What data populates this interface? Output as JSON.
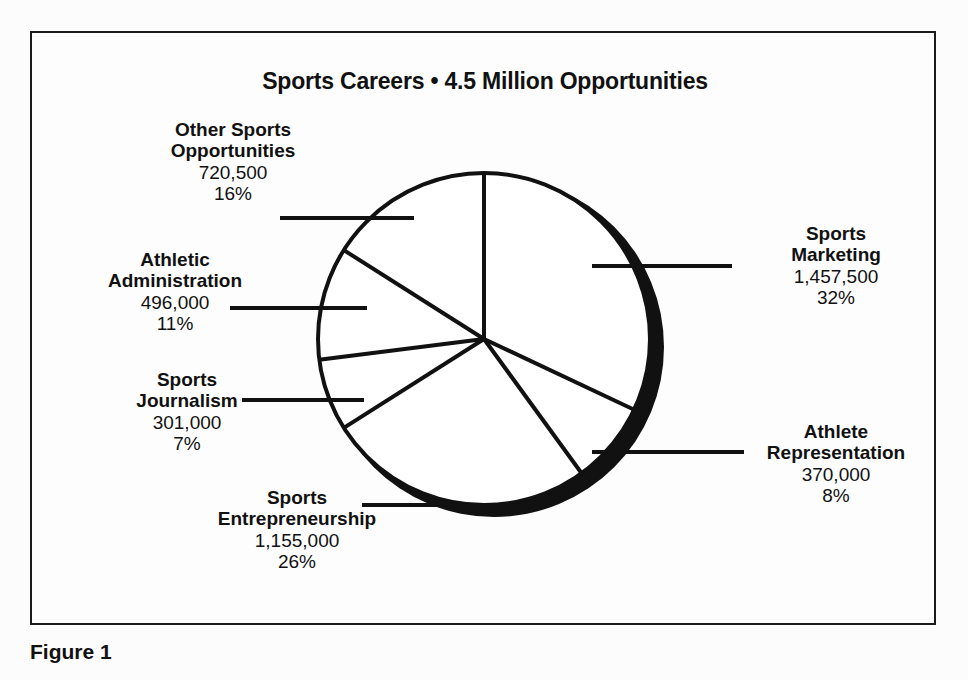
{
  "figure": {
    "title": "Sports Careers • 4.5 Million Opportunities",
    "caption": "Figure 1"
  },
  "colors": {
    "ink": "#111111",
    "slice_fill": "#ffffff",
    "shadow": "#111111",
    "background": "#fdfdfd"
  },
  "chart_data": {
    "type": "pie",
    "title": "Sports Careers • 4.5 Million Opportunities",
    "total_label": "4.5 Million Opportunities",
    "total_value": 4500000,
    "legend_position": "callout-labels",
    "grid": false,
    "categories": [
      "Sports Marketing",
      "Athlete Representation",
      "Sports Entrepreneurship",
      "Sports Journalism",
      "Athletic Administration",
      "Other Sports Opportunities"
    ],
    "values": [
      1457500,
      370000,
      1155000,
      301000,
      496000,
      720500
    ],
    "percents": [
      32,
      8,
      26,
      7,
      11,
      16
    ],
    "value_labels": [
      "1,457,500",
      "370,000",
      "1,155,000",
      "301,000",
      "496,000",
      "720,500"
    ],
    "percent_labels": [
      "32%",
      "8%",
      "26%",
      "7%",
      "11%",
      "16%"
    ],
    "slices": [
      {
        "name": "Sports Marketing",
        "value": 1457500,
        "value_label": "1,457,500",
        "percent": 32,
        "percent_label": "32%",
        "name_line_1": "Sports",
        "name_line_2": "Marketing"
      },
      {
        "name": "Athlete Representation",
        "value": 370000,
        "value_label": "370,000",
        "percent": 8,
        "percent_label": "8%",
        "name_line_1": "Athlete",
        "name_line_2": "Representation"
      },
      {
        "name": "Sports Entrepreneurship",
        "value": 1155000,
        "value_label": "1,155,000",
        "percent": 26,
        "percent_label": "26%",
        "name_line_1": "Sports",
        "name_line_2": "Entrepreneurship"
      },
      {
        "name": "Sports Journalism",
        "value": 301000,
        "value_label": "301,000",
        "percent": 7,
        "percent_label": "7%",
        "name_line_1": "Sports",
        "name_line_2": "Journalism"
      },
      {
        "name": "Athletic Administration",
        "value": 496000,
        "value_label": "496,000",
        "percent": 11,
        "percent_label": "11%",
        "name_line_1": "Athletic",
        "name_line_2": "Administration"
      },
      {
        "name": "Other Sports Opportunities",
        "value": 720500,
        "value_label": "720,500",
        "percent": 16,
        "percent_label": "16%",
        "name_line_1": "Other Sports",
        "name_line_2": "Opportunities"
      }
    ]
  }
}
